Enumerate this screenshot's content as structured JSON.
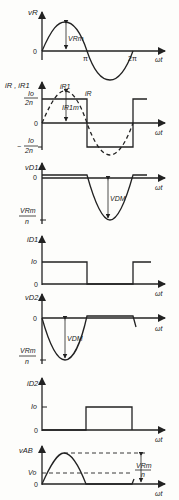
{
  "diagram": {
    "type": "waveforms",
    "x_axis_label": "ωt",
    "panels": [
      {
        "name": "v_R",
        "y_label": "vR",
        "annotations": {
          "zero": "0",
          "pi": "π",
          "two_pi": "2π",
          "amplitude": "VRm"
        },
        "waveform": "sine"
      },
      {
        "name": "i_R",
        "y_label": "iR , iR1",
        "annotations": {
          "plus_level_num": "Io",
          "plus_level_den": "2n",
          "minus_level_num": "Io",
          "minus_level_den": "2n",
          "minus_sign": "−",
          "zero": "0",
          "square_label": "iR",
          "dashed_label": "iR1",
          "fundamental_amp": "IR1m"
        },
        "waveform": "square + dashed fundamental sine"
      },
      {
        "name": "v_D1",
        "y_label": "vD1",
        "annotations": {
          "zero": "0",
          "level_num": "VRm",
          "level_den": "n",
          "dip": "VDM"
        },
        "waveform": "zero for 0..π, negative half-sine for π..2π"
      },
      {
        "name": "i_D1",
        "y_label": "iD1",
        "annotations": {
          "level": "Io",
          "zero": "0"
        },
        "waveform": "Io for 0..π, 0 for π..2π"
      },
      {
        "name": "v_D2",
        "y_label": "vD2",
        "annotations": {
          "zero": "0",
          "level_num": "VRm",
          "level_den": "n",
          "dip": "VDM"
        },
        "waveform": "negative half-sine for 0..π, zero for π..2π"
      },
      {
        "name": "i_D2",
        "y_label": "iD2",
        "annotations": {
          "level": "Io",
          "zero": "0"
        },
        "waveform": "0 for 0..π, Io for π..2π"
      },
      {
        "name": "v_AB",
        "y_label": "vAB",
        "annotations": {
          "avg": "Vo",
          "zero": "0",
          "peak_num": "VRm",
          "peak_den": "n"
        },
        "waveform": "positive half-sine 0..π, zero π..2π"
      }
    ]
  }
}
